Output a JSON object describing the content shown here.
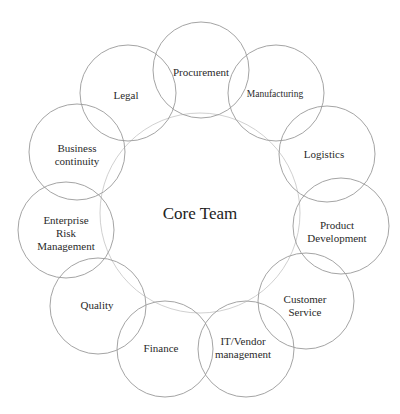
{
  "diagram": {
    "core": {
      "label": "Core Team",
      "cx": 200,
      "cy": 213,
      "r": 100
    },
    "satellite_radius": 48,
    "nodes": [
      {
        "id": "procurement",
        "label": "Procurement",
        "cx": 201,
        "cy": 70
      },
      {
        "id": "manufacturing",
        "label": "Manufacturing",
        "cx": 276,
        "cy": 93
      },
      {
        "id": "logistics",
        "label": "Logistics",
        "cx": 327,
        "cy": 154
      },
      {
        "id": "product-development",
        "label": "Product\nDevelopment",
        "cx": 341,
        "cy": 226
      },
      {
        "id": "customer-service",
        "label": "Customer\nService",
        "cx": 306,
        "cy": 301
      },
      {
        "id": "it-vendor-management",
        "label": "IT/Vendor\nmanagement",
        "cx": 246,
        "cy": 349
      },
      {
        "id": "finance",
        "label": "Finance",
        "cx": 165,
        "cy": 349
      },
      {
        "id": "quality",
        "label": "Quality",
        "cx": 98,
        "cy": 306
      },
      {
        "id": "enterprise-risk-management",
        "label": "Enterprise\nRisk\nManagement",
        "cx": 66,
        "cy": 230
      },
      {
        "id": "business-continuity",
        "label": "Business\ncontinuity",
        "cx": 77,
        "cy": 152
      },
      {
        "id": "legal",
        "label": "Legal",
        "cx": 128,
        "cy": 93
      }
    ]
  }
}
